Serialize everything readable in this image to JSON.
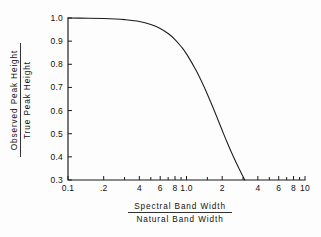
{
  "chart_data": {
    "type": "line",
    "title": "",
    "xlabel": "Spectral Band Width / Natural Band Width",
    "ylabel": "Observed Peak Height / True Peak Height",
    "xscale": "log",
    "yscale": "linear",
    "xlim": [
      0.1,
      10
    ],
    "ylim": [
      0.3,
      1.0
    ],
    "grid": false,
    "legend": null,
    "xtick_labels": [
      "0.1",
      ".2",
      "4",
      "6",
      "8",
      "1.0",
      "2",
      "4",
      "6",
      "8",
      "10"
    ],
    "xtick_values": [
      0.1,
      0.2,
      0.4,
      0.6,
      0.8,
      1.0,
      2,
      4,
      6,
      8,
      10
    ],
    "ytick_labels": [
      "0.3",
      "0.4",
      "0.5",
      "0.6",
      "0.7",
      "0.8",
      "0.9",
      "1.0"
    ],
    "ytick_values": [
      0.3,
      0.4,
      0.5,
      0.6,
      0.7,
      0.8,
      0.9,
      1.0
    ],
    "series": [
      {
        "name": "Observed/True peak height ratio",
        "x": [
          0.1,
          0.15,
          0.2,
          0.25,
          0.3,
          0.4,
          0.5,
          0.6,
          0.7,
          0.8,
          0.9,
          1.0,
          1.2,
          1.4,
          1.6,
          1.8,
          2.0,
          2.2,
          2.5,
          2.8,
          3.0,
          3.1
        ],
        "y": [
          1.0,
          0.999,
          0.998,
          0.996,
          0.993,
          0.985,
          0.972,
          0.955,
          0.933,
          0.907,
          0.877,
          0.845,
          0.775,
          0.705,
          0.637,
          0.573,
          0.515,
          0.463,
          0.398,
          0.345,
          0.315,
          0.3
        ]
      }
    ]
  },
  "ylabel_parts": {
    "numerator": "Observed  Peak  Height",
    "denominator": "True  Peak  Height"
  },
  "xlabel_parts": {
    "numerator": "Spectral  Band  Width",
    "denominator": "Natural  Band  Width"
  }
}
